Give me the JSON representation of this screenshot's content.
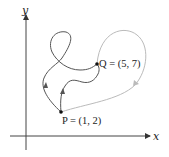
{
  "diagram": {
    "axes": {
      "x_label": "x",
      "y_label": "y"
    },
    "points": [
      {
        "name": "P",
        "label": "P = (1, 2)",
        "coords": [
          1,
          2
        ]
      },
      {
        "name": "Q",
        "label": "Q = (5, 7)",
        "coords": [
          5,
          7
        ]
      }
    ],
    "curves": [
      {
        "name": "loop-path",
        "color": "#555555",
        "description": "path from P to Q with a loop"
      },
      {
        "name": "wiggle-path",
        "color": "#555555",
        "description": "S-shaped path from P to Q"
      },
      {
        "name": "outer-path",
        "color": "#bbbbbb",
        "description": "wide arc from P around to Q"
      }
    ],
    "colors": {
      "axis": "#444444",
      "dark_curve": "#555555",
      "light_curve": "#bbbbbb"
    }
  }
}
